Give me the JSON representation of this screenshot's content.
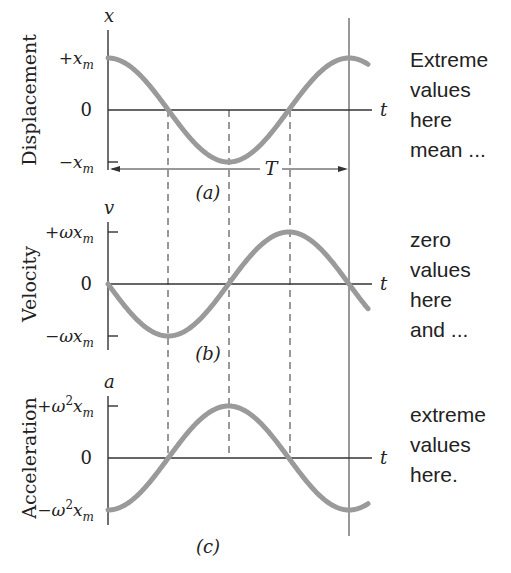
{
  "chart_data": [
    {
      "type": "line",
      "panel": "(a)",
      "title": "Displacement",
      "ylabel": "Displacement",
      "axis_var": "x",
      "xlabel": "t",
      "yticks": [
        "+x_m",
        "0",
        "-x_m"
      ],
      "function": "x(t) = x_m cos(ωt)",
      "x": [
        0,
        0.25,
        0.5,
        0.75,
        1.0
      ],
      "values": [
        1,
        0,
        -1,
        0,
        1
      ],
      "annotation": "T (period, from t=0 to t=T)",
      "note": "Extreme values here mean ..."
    },
    {
      "type": "line",
      "panel": "(b)",
      "title": "Velocity",
      "ylabel": "Velocity",
      "axis_var": "v",
      "xlabel": "t",
      "yticks": [
        "+ωx_m",
        "0",
        "-ωx_m"
      ],
      "function": "v(t) = -ωx_m sin(ωt)",
      "x": [
        0,
        0.25,
        0.5,
        0.75,
        1.0
      ],
      "values": [
        0,
        -1,
        0,
        1,
        0
      ],
      "note": "zero values here and ..."
    },
    {
      "type": "line",
      "panel": "(c)",
      "title": "Acceleration",
      "ylabel": "Acceleration",
      "axis_var": "a",
      "xlabel": "t",
      "yticks": [
        "+ω²x_m",
        "0",
        "-ω²x_m"
      ],
      "function": "a(t) = -ω²x_m cos(ωt)",
      "x": [
        0,
        0.25,
        0.5,
        0.75,
        1.0
      ],
      "values": [
        -1,
        0,
        1,
        0,
        -1
      ],
      "note": "extreme values here."
    }
  ],
  "panels": [
    {
      "ylabel": "Displacement",
      "var": "x",
      "pos": "+x",
      "neg": "−x",
      "sub": "m",
      "pos_pre": "+",
      "neg_pre": "−",
      "sup": "",
      "zero": "0",
      "t": "t",
      "tag": "(a)",
      "note": "Extreme\nvalues\nhere\nmean ..."
    },
    {
      "ylabel": "Velocity",
      "var": "v",
      "pos": "+ωx",
      "neg": "−ωx",
      "sub": "m",
      "sup": "",
      "zero": "0",
      "t": "t",
      "tag": "(b)",
      "note": "zero\nvalues\nhere\nand ..."
    },
    {
      "ylabel": "Acceleration",
      "var": "a",
      "pos": "+ω",
      "neg": "−ω",
      "sub": "m",
      "sup": "2",
      "zero": "0",
      "t": "t",
      "tag": "(c)",
      "note": "extreme\nvalues\nhere."
    }
  ],
  "period_label": "T",
  "colors": {
    "curve": "#9a9a9a",
    "axis": "#333333",
    "text": "#222222"
  }
}
